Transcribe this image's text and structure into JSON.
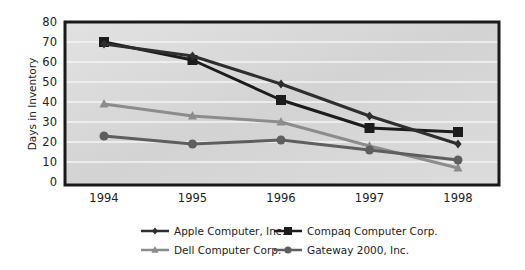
{
  "chart_data": {
    "type": "line",
    "title": "",
    "xlabel": "",
    "ylabel": "Days in Inventory",
    "x": [
      "1994",
      "1995",
      "1996",
      "1997",
      "1998"
    ],
    "ylim": [
      0,
      80
    ],
    "yticks": [
      0,
      10,
      20,
      30,
      40,
      50,
      60,
      70,
      80
    ],
    "grid": true,
    "legend_position": "bottom",
    "series": [
      {
        "name": "Apple Computer, Inc.",
        "marker": "diamond",
        "color": "#2e2e2e",
        "values": [
          69,
          63,
          49,
          33,
          19
        ]
      },
      {
        "name": "Compaq Computer Corp.",
        "marker": "square",
        "color": "#1c1c1c",
        "values": [
          70,
          61,
          41,
          27,
          25
        ]
      },
      {
        "name": "Dell Computer Corp.",
        "marker": "triangle",
        "color": "#8c8c8c",
        "values": [
          39,
          33,
          30,
          18,
          7
        ]
      },
      {
        "name": "Gateway 2000, Inc.",
        "marker": "circle",
        "color": "#5e5e5e",
        "values": [
          23,
          19,
          21,
          16,
          11
        ]
      }
    ]
  }
}
